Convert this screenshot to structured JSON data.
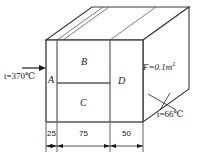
{
  "figure": {
    "sections": [
      {
        "id": "A",
        "label": "A"
      },
      {
        "id": "B",
        "label": "B"
      },
      {
        "id": "C",
        "label": "C"
      },
      {
        "id": "D",
        "label": "D"
      }
    ],
    "annotations": {
      "hot_side_temperature": "t=370℃",
      "cold_side_temperature": "t=66℃",
      "area": "F=0.1m",
      "area_exponent": "2",
      "heat_flow_arrow": "heat-flow-arrow"
    },
    "dimensions": [
      {
        "label": "25"
      },
      {
        "label": "75"
      },
      {
        "label": "50"
      }
    ],
    "colors": {
      "line": "#3a3a3a",
      "line_light": "#6e6e6e",
      "text": "#1b1b1b",
      "background": "#ffffff"
    }
  }
}
